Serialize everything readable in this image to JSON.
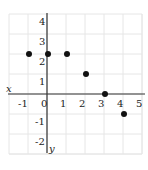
{
  "chart_data": {
    "type": "scatter",
    "title": "",
    "xlabel": "x",
    "ylabel": "y",
    "x_ticks": [
      -1,
      0,
      1,
      2,
      3,
      4,
      5
    ],
    "y_ticks": [
      -2,
      -1,
      1,
      2,
      3,
      4
    ],
    "x_tick_labels": [
      "-1",
      "0",
      "1",
      "2",
      "3",
      "4",
      "5"
    ],
    "y_tick_labels": [
      "-2",
      "-1",
      "1",
      "2",
      "3",
      "4"
    ],
    "xlim": [
      -2,
      5
    ],
    "ylim": [
      -3,
      4
    ],
    "grid": true,
    "legend": null,
    "series": [
      {
        "name": "points",
        "points": [
          {
            "x": -1,
            "y": 2
          },
          {
            "x": 0,
            "y": 2
          },
          {
            "x": 1,
            "y": 2
          },
          {
            "x": 2,
            "y": 1
          },
          {
            "x": 3,
            "y": 0
          },
          {
            "x": 4,
            "y": -1
          }
        ]
      }
    ],
    "colors": {
      "grid": "#e6e6e6",
      "axis": "#333333",
      "point": "#111111",
      "text": "#222222"
    }
  },
  "labels": {
    "x_axis": "x",
    "y_axis": "y"
  }
}
